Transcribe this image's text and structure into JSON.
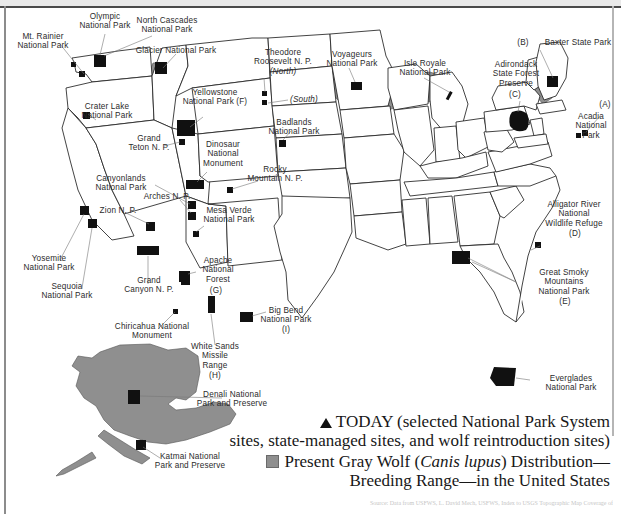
{
  "map": {
    "title": "Gray Wolf Distribution and National Park System Sites in the United States",
    "colors": {
      "wolf_range_gray": "#8f8f8f",
      "site_marker_black": "#111111",
      "state_outline": "#222222",
      "label_text": "#2b2b2b",
      "page_background": "#ffffff"
    }
  },
  "labels": [
    {
      "id": "olympic",
      "text": "Olympic\nNational Park"
    },
    {
      "id": "mt-rainier",
      "text": "Mt. Rainier\nNational Park"
    },
    {
      "id": "north-cascades",
      "text": "North Cascades\nNational Park"
    },
    {
      "id": "glacier",
      "text": "Glacier National Park"
    },
    {
      "id": "crater-lake",
      "text": "Crater Lake\nNational Park"
    },
    {
      "id": "yellowstone",
      "text": "Yellowstone\nNational Park (F)"
    },
    {
      "id": "theodore-roosevelt",
      "text": "Theodore\nRoosevelt N. P."
    },
    {
      "id": "theodore-roosevelt-north",
      "text": "(North)"
    },
    {
      "id": "theodore-roosevelt-south",
      "text": "(South)"
    },
    {
      "id": "voyageurs",
      "text": "Voyageurs\nNational Park"
    },
    {
      "id": "isle-royale",
      "text": "Isle Royale\nNational Park"
    },
    {
      "id": "baxter",
      "text": "Baxter State Park"
    },
    {
      "id": "baxter-key",
      "text": "(B)"
    },
    {
      "id": "adirondack",
      "text": "Adirondack\nState Forest\nPreserve"
    },
    {
      "id": "adirondack-key",
      "text": "(C)"
    },
    {
      "id": "acadia",
      "text": "Acadia\nNational\nPark"
    },
    {
      "id": "acadia-key",
      "text": "(A)"
    },
    {
      "id": "badlands",
      "text": "Badlands\nNational Park"
    },
    {
      "id": "grand-teton",
      "text": "Grand\nTeton N. P."
    },
    {
      "id": "dinosaur",
      "text": "Dinosaur\nNational\nMonument"
    },
    {
      "id": "rocky-mountain",
      "text": "Rocky\nMountain N. P."
    },
    {
      "id": "canyonlands",
      "text": "Canyonlands\nNational Park"
    },
    {
      "id": "arches",
      "text": "Arches N. P."
    },
    {
      "id": "zion",
      "text": "Zion N. P."
    },
    {
      "id": "mesa-verde",
      "text": "Mesa Verde\nNational Park"
    },
    {
      "id": "yosemite",
      "text": "Yosemite\nNational Park"
    },
    {
      "id": "sequoia",
      "text": "Sequoia\nNational Park"
    },
    {
      "id": "grand-canyon",
      "text": "Grand\nCanyon N. P."
    },
    {
      "id": "apache",
      "text": "Apache\nNational\nForest"
    },
    {
      "id": "apache-key",
      "text": "(G)"
    },
    {
      "id": "chiricahua",
      "text": "Chiricahua National\nMonument"
    },
    {
      "id": "white-sands",
      "text": "White  Sands\nMissile\nRange"
    },
    {
      "id": "white-sands-key",
      "text": "(H)"
    },
    {
      "id": "big-bend",
      "text": "Big Bend\nNational Park"
    },
    {
      "id": "big-bend-key",
      "text": "(I)"
    },
    {
      "id": "alligator-river",
      "text": "Alligator River\nNational\nWildlife Refuge"
    },
    {
      "id": "alligator-river-key",
      "text": "(D)"
    },
    {
      "id": "great-smoky",
      "text": "Great Smoky\nMountains\nNational Park"
    },
    {
      "id": "great-smoky-key",
      "text": "(E)"
    },
    {
      "id": "everglades",
      "text": "Everglades\nNational Park"
    },
    {
      "id": "denali",
      "text": "Denali National\nPark and Preserve"
    },
    {
      "id": "katmai",
      "text": "Katmai National\nPark and Preserve"
    }
  ],
  "legend": {
    "today_line1": "TODAY (selected National Park System",
    "today_line2": "sites, state-managed sites, and wolf reintroduction sites)",
    "range_line1_a": "Present Gray Wolf (",
    "range_line1_italic": "Canis lupus",
    "range_line1_b": ") Distribution—",
    "range_line2": "Breeding Range—in the United States",
    "triangle_icon": "triangle-marker-icon",
    "square_icon": "gray-square-marker-icon"
  },
  "credit": {
    "text": "Source: Data from USFWS, L. David Mech, USFWS, Index to USGS Topographic Map Coverage of"
  }
}
